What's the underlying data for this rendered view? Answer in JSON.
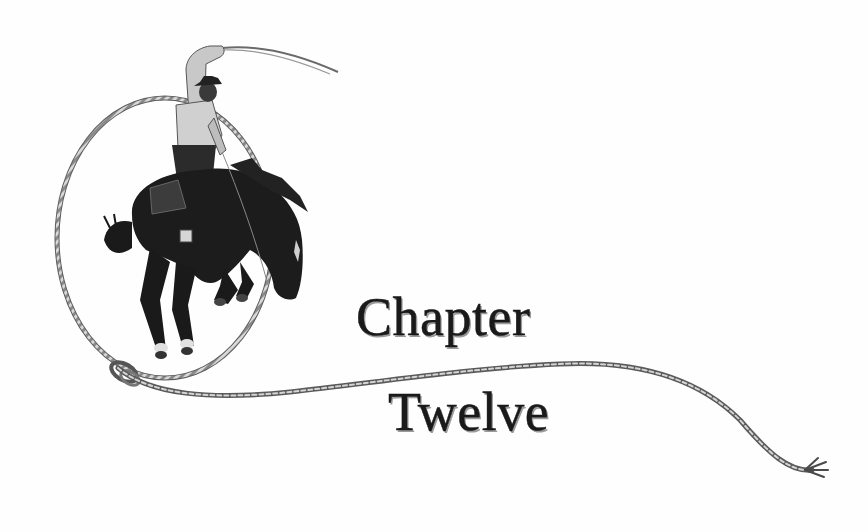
{
  "heading": {
    "line1": "Chapter",
    "line2": "Twelve"
  },
  "illustration": {
    "subject": "bronco-rider-with-lasso",
    "rope_color": "#6f6f6f",
    "horse_color": "#1c1c1c",
    "rider_shirt_color": "#cfcfcf"
  },
  "colors": {
    "background": "#fefefe",
    "text": "#1a1a1a",
    "text_shadow": "#9a9a9a"
  }
}
